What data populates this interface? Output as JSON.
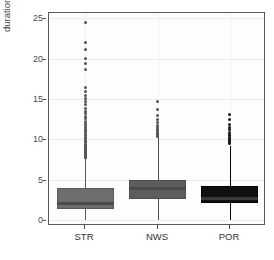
{
  "chart_data": {
    "type": "box",
    "title": "",
    "xlabel": "",
    "ylabel": "duration (s)",
    "ylim": [
      -0.6,
      25.8
    ],
    "yticks": [
      0,
      5,
      10,
      15,
      20,
      25
    ],
    "ytick_labels": [
      "0",
      "5",
      "10",
      "15",
      "20",
      "25"
    ],
    "categories": [
      "STR",
      "NWS",
      "POR"
    ],
    "grid": "horizontal and vertical light gridlines",
    "legend": "none",
    "boxes": [
      {
        "category": "STR",
        "fill_color": "#6e6e6e",
        "border_color": "#5a5a5a",
        "whisker_low": 0.15,
        "q1": 1.55,
        "median": 2.2,
        "q3": 4.1,
        "whisker_high": 7.7,
        "outliers": [
          24.6,
          22.1,
          21.3,
          20.1,
          19.6,
          18.8,
          16.6,
          16.1,
          15.6,
          15.2,
          14.8,
          14.4,
          14.0,
          13.6,
          13.3,
          13.0,
          12.7,
          12.4,
          12.1,
          11.9,
          11.6,
          11.4,
          11.2,
          11.0,
          10.8,
          10.6,
          10.4,
          10.2,
          10.0,
          9.85,
          9.7,
          9.55,
          9.4,
          9.25,
          9.1,
          8.95,
          8.8,
          8.7,
          8.6,
          8.5,
          8.4,
          8.3,
          8.2,
          8.1,
          8.0,
          7.95,
          7.9
        ]
      },
      {
        "category": "NWS",
        "fill_color": "#5d5d5d",
        "border_color": "#4d4d4d",
        "whisker_low": 0.1,
        "q1": 2.7,
        "median": 4.15,
        "q3": 5.15,
        "whisker_high": 10.4,
        "outliers": [
          14.8,
          13.8,
          13.1,
          12.6,
          12.2,
          11.9,
          11.6,
          11.4,
          11.2,
          11.0,
          10.85,
          10.7,
          10.6,
          10.5
        ]
      },
      {
        "category": "POR",
        "fill_color": "#101010",
        "border_color": "#000000",
        "whisker_low": 0.2,
        "q1": 2.25,
        "median": 2.9,
        "q3": 4.3,
        "whisker_high": 9.3,
        "outliers": [
          13.2,
          12.6,
          12.0,
          11.6,
          11.3,
          11.0,
          10.8,
          10.6,
          10.4,
          10.25,
          10.1,
          10.0,
          9.9,
          9.8,
          9.7,
          9.6
        ]
      }
    ]
  }
}
